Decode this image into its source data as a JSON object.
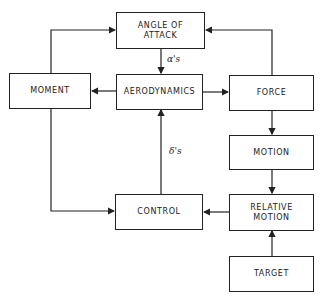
{
  "diagram": {
    "boxes": {
      "angle_of_attack": "ANGLE OF\nATTACK",
      "moment": "MOMENT",
      "aerodynamics": "AERODYNAMICS",
      "force": "FORCE",
      "motion": "MOTION",
      "control": "CONTROL",
      "relative_motion": "RELATIVE\nMOTION",
      "target": "TARGET"
    },
    "labels": {
      "alpha": "α's",
      "delta": "δ's"
    },
    "edges": [
      {
        "from": "angle_of_attack",
        "to": "aerodynamics",
        "label": "α's"
      },
      {
        "from": "aerodynamics",
        "to": "moment"
      },
      {
        "from": "aerodynamics",
        "to": "force"
      },
      {
        "from": "moment",
        "to": "angle_of_attack"
      },
      {
        "from": "force",
        "to": "angle_of_attack"
      },
      {
        "from": "force",
        "to": "motion"
      },
      {
        "from": "motion",
        "to": "relative_motion"
      },
      {
        "from": "target",
        "to": "relative_motion"
      },
      {
        "from": "relative_motion",
        "to": "control"
      },
      {
        "from": "moment",
        "to": "control"
      },
      {
        "from": "control",
        "to": "aerodynamics",
        "label": "δ's"
      }
    ],
    "line_color": "#222222"
  }
}
